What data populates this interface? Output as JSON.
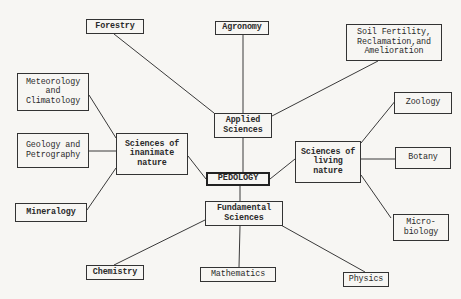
{
  "diagram": {
    "center": {
      "id": "pedology",
      "label": "PEDOLOGY"
    },
    "nodes": [
      {
        "id": "pedology",
        "label": "PEDOLOGY"
      },
      {
        "id": "applied",
        "label": "Applied\nSciences"
      },
      {
        "id": "fundamental",
        "label": "Fundamental\nSciences"
      },
      {
        "id": "inanimate",
        "label": "Sciences of\ninanimate\nnature"
      },
      {
        "id": "living",
        "label": "Sciences of\nliving\nnature"
      },
      {
        "id": "forestry",
        "label": "Forestry"
      },
      {
        "id": "agronomy",
        "label": "Agronomy"
      },
      {
        "id": "soil",
        "label": "Soil Fertility,\nReclamation,and\nAmelioration"
      },
      {
        "id": "meteorology",
        "label": "Meteorology\nand\nClimatology"
      },
      {
        "id": "geology",
        "label": "Geology and\nPetrography"
      },
      {
        "id": "mineralogy",
        "label": "Mineralogy"
      },
      {
        "id": "zoology",
        "label": "Zoology"
      },
      {
        "id": "botany",
        "label": "Botany"
      },
      {
        "id": "microbiology",
        "label": "Micro-\nbiology"
      },
      {
        "id": "chemistry",
        "label": "Chemistry"
      },
      {
        "id": "mathematics",
        "label": "Mathematics"
      },
      {
        "id": "physics",
        "label": "Physics"
      }
    ],
    "edges": [
      [
        "pedology",
        "applied"
      ],
      [
        "pedology",
        "fundamental"
      ],
      [
        "pedology",
        "inanimate"
      ],
      [
        "pedology",
        "living"
      ],
      [
        "applied",
        "forestry"
      ],
      [
        "applied",
        "agronomy"
      ],
      [
        "applied",
        "soil"
      ],
      [
        "inanimate",
        "meteorology"
      ],
      [
        "inanimate",
        "geology"
      ],
      [
        "inanimate",
        "mineralogy"
      ],
      [
        "living",
        "zoology"
      ],
      [
        "living",
        "botany"
      ],
      [
        "living",
        "microbiology"
      ],
      [
        "fundamental",
        "chemistry"
      ],
      [
        "fundamental",
        "mathematics"
      ],
      [
        "fundamental",
        "physics"
      ]
    ]
  }
}
